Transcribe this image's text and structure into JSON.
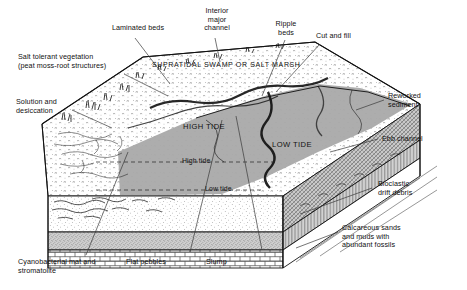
{
  "figure": {
    "type": "geological-block-diagram"
  },
  "colors": {
    "ink": "#111111",
    "tidal_gray": "#a9a9a9",
    "tidal_gray_dark": "#8f8f8f",
    "side_face": "#bdbdbd",
    "strata_band": "#b8b8b8",
    "limestone": "#ffffff",
    "leader": "#3a3a3a"
  },
  "block_labels": {
    "supratidal": "SUPRATIDAL SWAMP\nOR SALT MARSH",
    "high_tide_caps": "HIGH TIDE",
    "low_tide_caps": "LOW TIDE",
    "high_tide_line": "High tide",
    "low_tide_line": "Low tide"
  },
  "annotations": [
    {
      "id": "laminated-beds",
      "text": "Laminated beds"
    },
    {
      "id": "interior-major-channel",
      "text": "Interior\nmajor\nchannel"
    },
    {
      "id": "ripple-beds",
      "text": "Ripple\nbeds"
    },
    {
      "id": "cut-and-fill",
      "text": "Cut and fill"
    },
    {
      "id": "salt-tolerant-vegetation",
      "text": "Salt tolerant vegetation\n(peat moss-root structures)"
    },
    {
      "id": "solution-and-desiccation",
      "text": "Solution and\ndesiccation"
    },
    {
      "id": "reworked-sediment",
      "text": "Reworked\nsediment"
    },
    {
      "id": "ebb-channel",
      "text": "Ebb channel"
    },
    {
      "id": "bioclastic-drift-debris",
      "text": "Bioclastic\ndrift debris"
    },
    {
      "id": "calcareous-sands",
      "text": "Calcareous sands\nand muds with\nabundant fossils"
    },
    {
      "id": "cyanobacterial-mat",
      "text": "Cyanobacterial mat and\nstromatolite"
    },
    {
      "id": "flat-pebbles",
      "text": "Flat pebbles"
    },
    {
      "id": "slump",
      "text": "Slump"
    }
  ]
}
